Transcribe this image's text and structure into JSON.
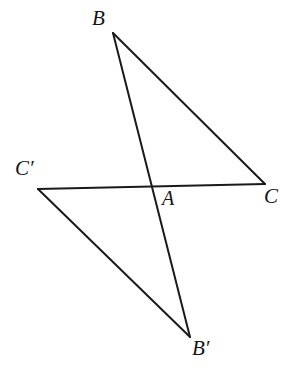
{
  "figure": {
    "name": "two-triangles-vertical-angles",
    "background_color": "#ffffff",
    "stroke_color": "#1a1a1a",
    "stroke_width": 2,
    "width": 294,
    "height": 373
  },
  "points": {
    "B": {
      "label": "B",
      "x": 113,
      "y": 33
    },
    "C": {
      "label": "C",
      "x": 265,
      "y": 184
    },
    "A": {
      "label": "A",
      "x": 150,
      "y": 185
    },
    "C_prime": {
      "label": "C′",
      "x": 38,
      "y": 189
    },
    "B_prime": {
      "label": "B′",
      "x": 190,
      "y": 337
    }
  },
  "labels": [
    {
      "id": "label-B",
      "text": "B",
      "x": 92,
      "y": 8,
      "font_size": 21
    },
    {
      "id": "label-C",
      "text": "C",
      "x": 264,
      "y": 186,
      "font_size": 21
    },
    {
      "id": "label-A",
      "text": "A",
      "x": 162,
      "y": 188,
      "font_size": 20
    },
    {
      "id": "label-C-prime",
      "text": "C′",
      "x": 15,
      "y": 158,
      "font_size": 21
    },
    {
      "id": "label-B-prime",
      "text": "B′",
      "x": 192,
      "y": 338,
      "font_size": 21
    }
  ],
  "segments": [
    {
      "id": "segment-B-C",
      "from": "B",
      "to": "C",
      "d": "M 113 33 L 265 184"
    },
    {
      "id": "segment-B-Bprime",
      "from": "B",
      "to": "B_prime",
      "d": "M 113 33 L 190 337"
    },
    {
      "id": "segment-Cprime-C",
      "from": "C_prime",
      "to": "C",
      "d": "M 38 189 L 265 184"
    },
    {
      "id": "segment-Cprime-Bprime",
      "from": "C_prime",
      "to": "B_prime",
      "d": "M 38 189 L 190 337"
    }
  ]
}
